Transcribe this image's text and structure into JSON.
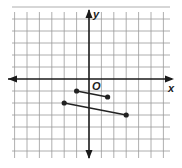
{
  "figure": {
    "x_axis_label": "x",
    "y_axis_label": "y",
    "origin_label": "O",
    "grid": {
      "x_min": -6,
      "x_max": 6,
      "y_min": -6,
      "y_max": 6
    },
    "segments": [
      {
        "name": "short-segment",
        "from": [
          -1,
          -1
        ],
        "to": [
          1.5,
          -1.5
        ]
      },
      {
        "name": "long-segment",
        "from": [
          -2,
          -2
        ],
        "to": [
          3,
          -3
        ]
      }
    ],
    "colors": {
      "grid": "#9a9a9a",
      "axis": "#1a1a1a",
      "segment": "#222222"
    }
  }
}
